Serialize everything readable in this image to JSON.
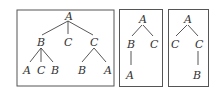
{
  "diagram": {
    "trees": [
      {
        "name": "tree-1",
        "nodes": {
          "root": "A",
          "l1": [
            "B",
            "C",
            "C"
          ],
          "b_children": [
            "A",
            "C",
            "B"
          ],
          "c2_children": [
            "B",
            "A"
          ]
        }
      },
      {
        "name": "tree-2",
        "nodes": {
          "root": "A",
          "l1": [
            "B",
            "C"
          ],
          "b_children": [
            "A"
          ]
        }
      },
      {
        "name": "tree-3",
        "nodes": {
          "root": "A",
          "l1": [
            "C",
            "C"
          ],
          "c2_children": [
            "B"
          ]
        }
      }
    ]
  }
}
